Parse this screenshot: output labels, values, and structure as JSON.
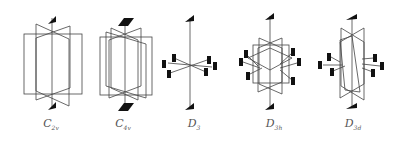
{
  "figures": [
    {
      "id": "c2v",
      "label": "C",
      "sub": "2v",
      "axis_symbol": "2-fold (lens)",
      "planes": 2,
      "perp_axes": 0
    },
    {
      "id": "c4v",
      "label": "C",
      "sub": "4v",
      "axis_symbol": "4-fold (square)",
      "planes": 4,
      "perp_axes": 0
    },
    {
      "id": "d3",
      "label": "D",
      "sub": "3",
      "axis_symbol": "3-fold (triangle)",
      "planes": 0,
      "perp_axes": 3
    },
    {
      "id": "d3h",
      "label": "D",
      "sub": "3h",
      "axis_symbol": "3-fold (triangle)",
      "planes": 4,
      "perp_axes": 3
    },
    {
      "id": "d3d",
      "label": "D",
      "sub": "3d",
      "axis_symbol": "3-fold (triangle)",
      "planes": 3,
      "perp_axes": 3
    }
  ],
  "colors": {
    "line": "#444444",
    "symbol": "#111111",
    "label": "#555555"
  }
}
